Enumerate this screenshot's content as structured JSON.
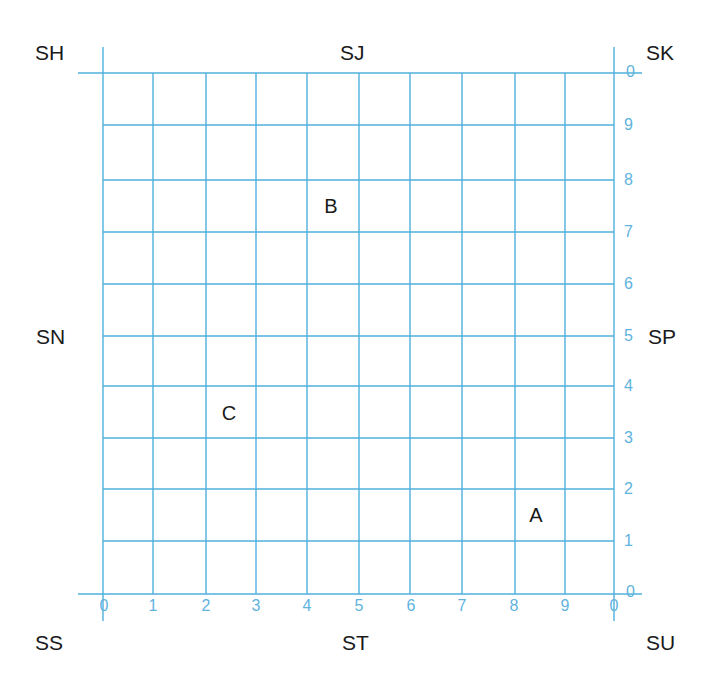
{
  "title_clipped": "",
  "grid": {
    "line_color": "#4fb0de",
    "label_color": "#5fb3dd",
    "x_lines": [
      103,
      153,
      206,
      256,
      307,
      359,
      410,
      462,
      515,
      565,
      614
    ],
    "y_lines": [
      73,
      125,
      180,
      232,
      284,
      336,
      386,
      438,
      489,
      541,
      594
    ]
  },
  "x_axis_labels": [
    "0",
    "1",
    "2",
    "3",
    "4",
    "5",
    "6",
    "7",
    "8",
    "9",
    "0"
  ],
  "y_axis_labels": [
    "0",
    "1",
    "2",
    "3",
    "4",
    "5",
    "6",
    "7",
    "8",
    "9",
    "0"
  ],
  "corner_extra_tick": "0",
  "grid_squares": {
    "top_left": "SH",
    "top_middle": "SJ",
    "top_right": "SK",
    "middle_left": "SN",
    "middle_right": "SP",
    "bottom_left": "SS",
    "bottom_middle": "ST",
    "bottom_right": "SU"
  },
  "points": [
    {
      "label": "A",
      "x": 536,
      "y": 515
    },
    {
      "label": "B",
      "x": 331,
      "y": 206
    },
    {
      "label": "C",
      "x": 229,
      "y": 413
    }
  ]
}
